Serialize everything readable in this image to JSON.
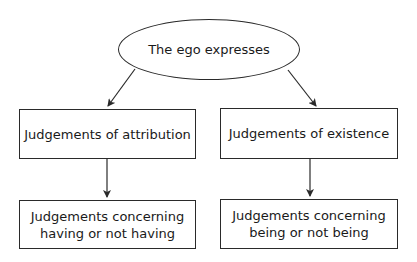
{
  "diagram": {
    "type": "flowchart",
    "root": {
      "label": "The ego expresses",
      "shape": "ellipse"
    },
    "level1": [
      {
        "label": "Judgements of attribution",
        "shape": "rectangle"
      },
      {
        "label": "Judgements of existence",
        "shape": "rectangle"
      }
    ],
    "level2": [
      {
        "line1": "Judgements concerning",
        "line2": "having or not having",
        "shape": "rectangle"
      },
      {
        "line1": "Judgements concerning",
        "line2": "being or not being",
        "shape": "rectangle"
      }
    ],
    "edges": [
      {
        "from": "The ego expresses",
        "to": "Judgements of attribution"
      },
      {
        "from": "The ego expresses",
        "to": "Judgements of existence"
      },
      {
        "from": "Judgements of attribution",
        "to": "Judgements concerning having or not having"
      },
      {
        "from": "Judgements of existence",
        "to": "Judgements concerning being or not being"
      }
    ],
    "colors": {
      "stroke": "#2a2a2a",
      "text": "#1a1a1a",
      "background": "#ffffff"
    }
  }
}
